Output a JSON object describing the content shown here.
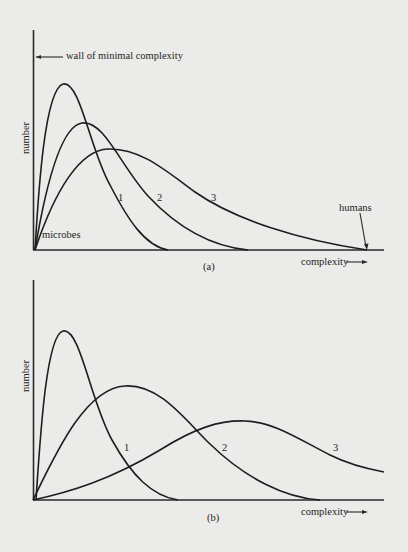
{
  "panel_a": {
    "caption": "(a)",
    "y_label": "number",
    "x_label": "complexity",
    "wall_label": "wall of minimal complexity",
    "left_annotation": "microbes",
    "right_annotation": "humans",
    "curves": [
      {
        "id": "1",
        "label": "1"
      },
      {
        "id": "2",
        "label": "2"
      },
      {
        "id": "3",
        "label": "3"
      }
    ]
  },
  "panel_b": {
    "caption": "(b)",
    "y_label": "number",
    "x_label": "complexity",
    "curves": [
      {
        "id": "1",
        "label": "1"
      },
      {
        "id": "2",
        "label": "2"
      },
      {
        "id": "3",
        "label": "3"
      }
    ]
  },
  "colors": {
    "background": "#ebebe9",
    "ink": "#1e1e1e"
  }
}
